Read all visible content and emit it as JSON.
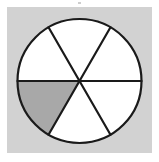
{
  "figure": {
    "kind": "fraction-circle",
    "panel_background_color": "#d2d2d2",
    "page_background_color": "#ffffff",
    "outline_color": "#1a1a1a",
    "unshaded_sector_color": "#ffffff",
    "shaded_sector_color": "#a8a8a8",
    "stroke_width_outline": 2.2,
    "stroke_width_divider": 2.2,
    "center_x": 79.5,
    "center_y": 81,
    "radius": 62,
    "total_sectors": 6,
    "shaded_sectors": 1,
    "fraction_shaded": "1/6",
    "sector_angle_degrees": 60,
    "labels": []
  },
  "chart_data": {
    "type": "pie",
    "xlabel": "",
    "ylabel": "",
    "categories": [
      "sector-1",
      "sector-2",
      "sector-3",
      "sector-4",
      "sector-5",
      "sector-6"
    ],
    "values": [
      60,
      60,
      60,
      60,
      60,
      60
    ],
    "units": "degrees",
    "legend": [],
    "grid": false,
    "slices": [
      {
        "name": "sector-1",
        "start_angle_deg": 0,
        "end_angle_deg": 60,
        "value": 60,
        "shaded": false,
        "color": "#ffffff",
        "position": "right-upper"
      },
      {
        "name": "sector-2",
        "start_angle_deg": 60,
        "end_angle_deg": 120,
        "value": 60,
        "shaded": false,
        "color": "#ffffff",
        "position": "top"
      },
      {
        "name": "sector-3",
        "start_angle_deg": 120,
        "end_angle_deg": 180,
        "value": 60,
        "shaded": false,
        "color": "#ffffff",
        "position": "left-upper"
      },
      {
        "name": "sector-4",
        "start_angle_deg": 180,
        "end_angle_deg": 240,
        "value": 60,
        "shaded": true,
        "color": "#a8a8a8",
        "position": "left-lower"
      },
      {
        "name": "sector-5",
        "start_angle_deg": 240,
        "end_angle_deg": 300,
        "value": 60,
        "shaded": false,
        "color": "#ffffff",
        "position": "bottom"
      },
      {
        "name": "sector-6",
        "start_angle_deg": 300,
        "end_angle_deg": 360,
        "value": 60,
        "shaded": false,
        "color": "#ffffff",
        "position": "right-lower"
      }
    ]
  }
}
